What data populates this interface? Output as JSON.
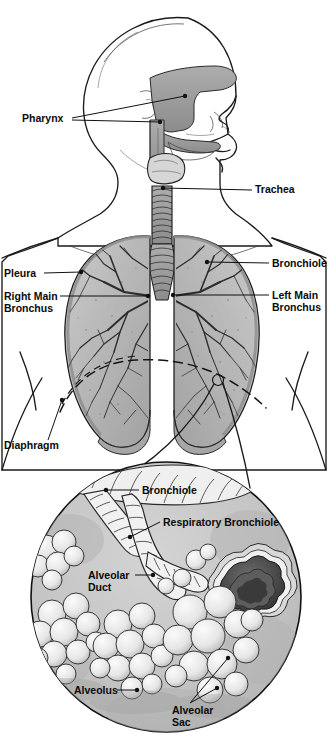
{
  "figure": {
    "kind": "anatomical-illustration",
    "style": "grayscale pencil/ink medical illustration",
    "width": 328,
    "height": 738
  },
  "palette": {
    "background": "#ffffff",
    "ink": "#111111",
    "skin_fill": "#fdfdfd",
    "airway_gray": "#9a9a9a",
    "airway_gray_dark": "#7d7d7d",
    "lung_fill": "#b9b9b9",
    "lung_fill_light": "#cfcfcf",
    "lung_vessel": "#2f2f2f",
    "pleura_edge": "#8f8f8f",
    "diaphragm_fill": "#a8a8a8",
    "inset_bg": "#c2c2c2",
    "alveoli_fill": "#ededed",
    "alveoli_shade": "#b5b5b5",
    "rosette_dark": "#3c3c3c",
    "rosette_mid": "#6e6e6e"
  },
  "upper_figure": {
    "name": "head-neck-thorax",
    "labels": [
      {
        "id": "pharynx",
        "text": "Pharynx",
        "x": 22,
        "y": 122,
        "anchor": "start",
        "leaders": [
          {
            "points": "72,118 185,96",
            "dot": [
              185,
              96
            ]
          },
          {
            "points": "72,120 160,122",
            "dot": [
              160,
              122
            ]
          }
        ]
      },
      {
        "id": "trachea",
        "text": "Trachea",
        "x": 255,
        "y": 193,
        "anchor": "start",
        "leaders": [
          {
            "points": "252,190 163,188",
            "dot": [
              163,
              188
            ]
          }
        ]
      },
      {
        "id": "pleura",
        "text": "Pleura",
        "x": 4,
        "y": 277,
        "anchor": "start",
        "leaders": [
          {
            "points": "44,273 81,272",
            "dot": [
              81,
              272
            ]
          }
        ]
      },
      {
        "id": "right-main-bronchus",
        "text": "Right Main",
        "text2": "Bronchus",
        "x": 4,
        "y": 300,
        "y2": 312,
        "anchor": "start",
        "leaders": [
          {
            "points": "60,296 148,296",
            "dot": [
              148,
              296
            ]
          }
        ]
      },
      {
        "id": "bronchiole-lung",
        "text": "Bronchiole",
        "x": 272,
        "y": 267,
        "anchor": "start",
        "leaders": [
          {
            "points": "269,263 207,262",
            "dot": [
              207,
              262
            ]
          }
        ]
      },
      {
        "id": "left-main-bronchus",
        "text": "Left Main",
        "text2": "Bronchus",
        "x": 272,
        "y": 299,
        "y2": 311,
        "anchor": "start",
        "leaders": [
          {
            "points": "269,295 173,295",
            "dot": [
              173,
              295
            ]
          }
        ]
      },
      {
        "id": "diaphragm",
        "text": "Diaphragm",
        "x": 4,
        "y": 449,
        "anchor": "start",
        "leaders": [
          {
            "points": "48,440 62,400",
            "dot": [
              62,
              400
            ]
          }
        ]
      }
    ]
  },
  "inset_figure": {
    "name": "alveolar-detail-circle",
    "center": [
      166,
      597
    ],
    "radius": 136,
    "marker_on_lung": {
      "x": 218,
      "y": 380,
      "r": 5
    },
    "labels": [
      {
        "id": "bronchiole-inset",
        "text": "Bronchiole",
        "x": 142,
        "y": 494,
        "anchor": "start",
        "leaders": [
          {
            "points": "139,490 106,490",
            "dot": [
              106,
              490
            ]
          }
        ]
      },
      {
        "id": "respiratory-bronchiole",
        "text": "Respiratory Bronchiole",
        "x": 163,
        "y": 526,
        "anchor": "start",
        "leaders": [
          {
            "points": "160,522 130,537",
            "dot": [
              130,
              537
            ]
          }
        ]
      },
      {
        "id": "alveolar-duct",
        "text": "Alveolar",
        "text2": "Duct",
        "x": 88,
        "y": 579,
        "y2": 591,
        "anchor": "start",
        "leaders": [
          {
            "points": "135,575 153,575",
            "dot": [
              153,
              575
            ]
          }
        ]
      },
      {
        "id": "alveolus",
        "text": "Alveolus",
        "x": 74,
        "y": 694,
        "anchor": "start",
        "leaders": [
          {
            "points": "117,690 137,690",
            "dot": [
              137,
              690
            ]
          }
        ]
      },
      {
        "id": "alveolar-sac",
        "text": "Alveolar",
        "text2": "Sac",
        "x": 172,
        "y": 714,
        "y2": 726,
        "anchor": "start",
        "leaders": [
          {
            "points": "190,703 217,688",
            "dot": [
              217,
              688
            ]
          },
          {
            "points": "190,703 228,658",
            "dot": [
              228,
              658
            ]
          }
        ]
      }
    ]
  },
  "label_index": [
    "Pharynx",
    "Trachea",
    "Pleura",
    "Right Main Bronchus",
    "Left Main Bronchus",
    "Bronchiole",
    "Diaphragm",
    "Bronchiole",
    "Respiratory Bronchiole",
    "Alveolar Duct",
    "Alveolus",
    "Alveolar Sac"
  ]
}
